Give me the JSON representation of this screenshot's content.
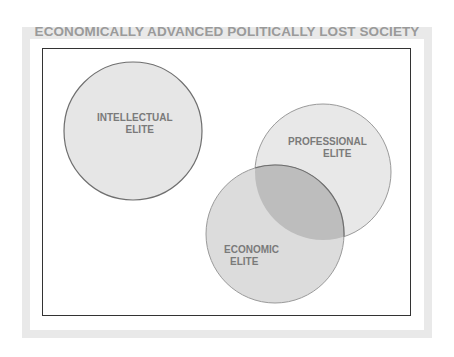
{
  "diagram": {
    "title": "ECONOMICALLY ADVANCED POLITICALLY LOST SOCIETY",
    "colors": {
      "frame": "#e9e9e9",
      "title_text": "#9a9a9a",
      "circle_fill": "#e6e6e6",
      "overlap_fill": "#bdbdbd",
      "circle_stroke": "#8a8a8a",
      "label_text": "#7a7a7a"
    },
    "circles": [
      {
        "id": "intellectual",
        "label_line1": "INTELLECTUAL",
        "label_line2": "ELITE"
      },
      {
        "id": "professional",
        "label_line1": "PROFESSIONAL",
        "label_line2": "ELITE"
      },
      {
        "id": "economic",
        "label_line1": "ECONOMIC",
        "label_line2": "ELITE"
      }
    ]
  }
}
